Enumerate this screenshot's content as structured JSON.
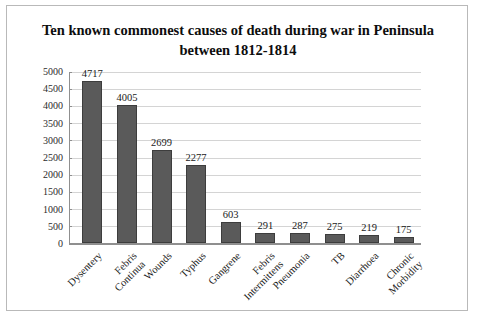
{
  "chart_data": {
    "type": "bar",
    "title": "Ten known commonest causes of death during war in Peninsula between 1812-1814",
    "categories": [
      "Dysentery",
      "Febris Continua",
      "Wounds",
      "Typhus",
      "Gangrene",
      "Febris Intermittens",
      "Pneumonia",
      "TB",
      "Diarrhoea",
      "Chronic Morbidity"
    ],
    "values": [
      4717,
      4005,
      2699,
      2277,
      603,
      291,
      287,
      275,
      219,
      175
    ],
    "xlabel": "",
    "ylabel": "",
    "ylim": [
      0,
      5000
    ],
    "yticks": [
      0,
      500,
      1000,
      1500,
      2000,
      2500,
      3000,
      3500,
      4000,
      4500,
      5000
    ],
    "ytick_labels": [
      "0",
      "500",
      "1000",
      "1500",
      "2000",
      "2500",
      "3000",
      "3500",
      "4000",
      "4500",
      "5000"
    ],
    "grid": true,
    "legend": "none",
    "bar_color": "#5a5a5a",
    "data_labels": [
      "4717",
      "4005",
      "2699",
      "2277",
      "603",
      "291",
      "287",
      "275",
      "219",
      "175"
    ]
  }
}
